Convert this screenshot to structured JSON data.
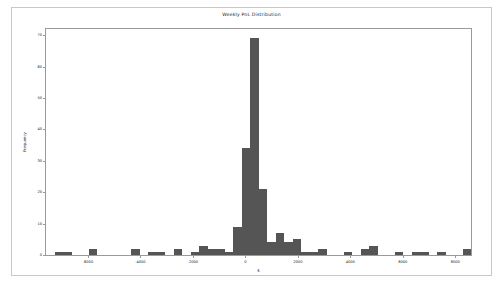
{
  "figure": {
    "background": "#ffffff",
    "frame_color": "#c8c8c8",
    "axes_color": "#9a9a9a"
  },
  "chart_data": {
    "type": "bar",
    "chart_subtype": "histogram",
    "title": "Weekly PnL Distribution",
    "xlabel": "$",
    "ylabel": "Frequency",
    "xlim": [
      -7600,
      8600
    ],
    "ylim": [
      0,
      72
    ],
    "grid": false,
    "legend": null,
    "bar_color": "#555555",
    "xticks": [
      -6000,
      -4000,
      -2000,
      0,
      2000,
      4000,
      6000,
      8000
    ],
    "xticklabels": [
      "-6000",
      "-4000",
      "-2000",
      "0",
      "2000",
      "4000",
      "6000",
      "8000"
    ],
    "yticks": [
      0,
      10,
      20,
      30,
      40,
      50,
      60,
      70
    ],
    "yticklabels": [
      "0",
      "10",
      "20",
      "30",
      "40",
      "50",
      "60",
      "70"
    ],
    "bin_width": 324,
    "bin_left_edges": [
      -7600,
      -7276,
      -6952,
      -6628,
      -6304,
      -5980,
      -5656,
      -5332,
      -5008,
      -4684,
      -4360,
      -4036,
      -3712,
      -3388,
      -3064,
      -2740,
      -2416,
      -2092,
      -1768,
      -1444,
      -1120,
      -796,
      -472,
      -148,
      176,
      500,
      824,
      1148,
      1472,
      1796,
      2120,
      2444,
      2768,
      3092,
      3416,
      3740,
      4064,
      4388,
      4712,
      5036,
      5360,
      5684,
      6008,
      6332,
      6656,
      6980,
      7304,
      7628,
      7952,
      8276
    ],
    "bin_centers": [
      -7438,
      -7114,
      -6790,
      -6466,
      -6142,
      -5818,
      -5494,
      -5170,
      -4846,
      -4522,
      -4198,
      -3874,
      -3550,
      -3226,
      -2902,
      -2578,
      -2254,
      -1930,
      -1606,
      -1282,
      -958,
      -634,
      -310,
      14,
      338,
      662,
      986,
      1310,
      1634,
      1958,
      2282,
      2606,
      2930,
      3254,
      3578,
      3902,
      4226,
      4550,
      4874,
      5198,
      5522,
      5846,
      6170,
      6494,
      6818,
      7142,
      7466,
      7790,
      8114,
      8438
    ],
    "values": [
      0,
      1,
      1,
      0,
      0,
      2,
      0,
      0,
      0,
      0,
      2,
      0,
      1,
      1,
      0,
      2,
      0,
      1,
      3,
      2,
      2,
      1,
      9,
      34,
      69,
      21,
      4,
      7,
      4,
      5,
      1,
      1,
      2,
      0,
      0,
      1,
      0,
      2,
      3,
      0,
      0,
      1,
      0,
      1,
      1,
      0,
      1,
      0,
      0,
      2
    ],
    "peak_value": 69,
    "peak_bin_center": 14
  }
}
